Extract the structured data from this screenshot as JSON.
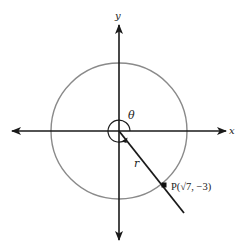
{
  "diagram": {
    "type": "coordinate-plane-angle",
    "axes": {
      "x_label": "x",
      "y_label": "y"
    },
    "circle": {
      "color": "#8a8a8a",
      "description": "circle centered at origin with radius r"
    },
    "angle": {
      "label": "θ",
      "description": "angle in standard position, rotating counterclockwise more than 270°"
    },
    "ray": {
      "label": "r",
      "color": "#1a1a1a"
    },
    "point": {
      "name": "P",
      "label": "P(√7, −3)",
      "x": "√7",
      "y": "−3"
    },
    "colors": {
      "axis": "#1a1a1a",
      "circle": "#8a8a8a",
      "background": "#ffffff"
    }
  }
}
